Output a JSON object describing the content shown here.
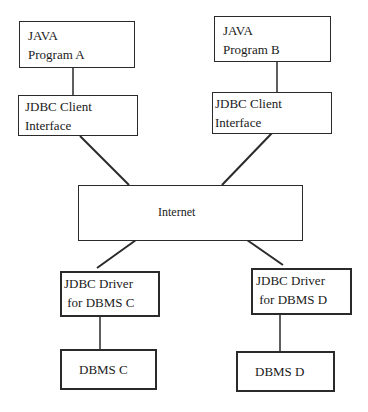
{
  "diagram": {
    "type": "architecture",
    "nodes": {
      "java_a": {
        "label": "JAVA\nProgram A"
      },
      "client_a": {
        "label": "JDBC Client\nInterface"
      },
      "java_b": {
        "label": "JAVA\nProgram B"
      },
      "client_b": {
        "label": "JDBC Client\nInterface"
      },
      "internet": {
        "label": "Internet"
      },
      "driver_c": {
        "label": "JDBC Driver\n for DBMS C"
      },
      "driver_d": {
        "label": "JDBC Driver\n for DBMS D"
      },
      "dbms_c": {
        "label": "DBMS C"
      },
      "dbms_d": {
        "label": "DBMS D"
      }
    },
    "edges": [
      {
        "from": "java_a",
        "to": "client_a"
      },
      {
        "from": "java_b",
        "to": "client_b"
      },
      {
        "from": "client_a",
        "to": "internet"
      },
      {
        "from": "client_b",
        "to": "internet"
      },
      {
        "from": "internet",
        "to": "driver_c"
      },
      {
        "from": "internet",
        "to": "driver_d"
      },
      {
        "from": "driver_c",
        "to": "dbms_c"
      },
      {
        "from": "driver_d",
        "to": "dbms_d"
      }
    ],
    "colors": {
      "line": "#2a2a2a",
      "background": "#ffffff"
    }
  }
}
